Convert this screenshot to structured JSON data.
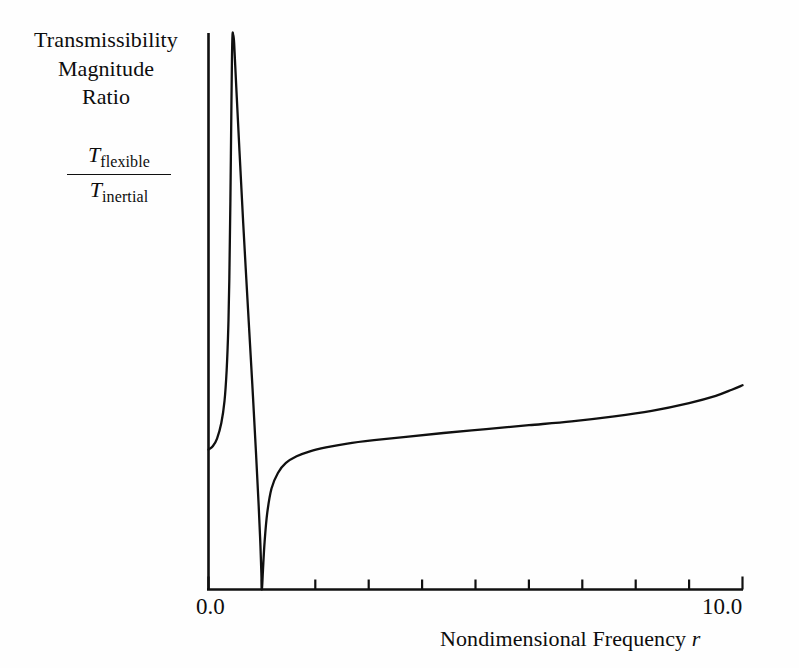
{
  "figure": {
    "background_color": "#fefefe",
    "ink_color": "#101010"
  },
  "y_axis": {
    "title_lines": [
      "Transmissibility",
      "Magnitude",
      "Ratio"
    ],
    "ratio": {
      "numerator_symbol": "T",
      "numerator_subscript": "flexible",
      "denominator_symbol": "T",
      "denominator_subscript": "inertial"
    }
  },
  "x_axis": {
    "title_prefix": "Nondimensional Frequency",
    "title_variable": "r",
    "tick_label_min": "0.0",
    "tick_label_max": "10.0"
  },
  "chart_data": {
    "type": "line",
    "title": "",
    "xlabel": "Nondimensional Frequency r",
    "ylabel": "Transmissibility Magnitude Ratio T_flexible / T_inertial",
    "xlim": [
      0.0,
      10.0
    ],
    "ylim": [
      0.0,
      1.0
    ],
    "grid": false,
    "legend": null,
    "xticks": [
      0.0,
      1.0,
      2.0,
      3.0,
      4.0,
      5.0,
      6.0,
      7.0,
      8.0,
      9.0,
      10.0
    ],
    "xtick_labels": [
      "0.0",
      "",
      "",
      "",
      "",
      "",
      "",
      "",
      "",
      "",
      "10.0"
    ],
    "yticks": [],
    "ytick_labels": [],
    "annotations": [
      "vertical asymptote (resonance) near r = 0.45",
      "zero / notch touching x-axis near r = 1.0",
      "curve truncated at top of axes frame"
    ],
    "series": [
      {
        "name": "T_flexible / T_inertial",
        "color": "#101010",
        "line_width": 2.0,
        "comment": "normalized y in [0,1]; values above 1.0 are clipped by the plot frame",
        "x": [
          0.0,
          0.08,
          0.16,
          0.24,
          0.3,
          0.34,
          0.37,
          0.39,
          0.41,
          0.43,
          0.44,
          0.45,
          0.46,
          0.48,
          0.52,
          0.58,
          0.65,
          0.74,
          0.82,
          0.89,
          0.94,
          0.97,
          0.99,
          1.0,
          1.02,
          1.05,
          1.1,
          1.18,
          1.3,
          1.45,
          1.65,
          1.9,
          2.2,
          2.6,
          3.1,
          3.7,
          4.4,
          5.2,
          6.0,
          6.8,
          7.6,
          8.3,
          9.0,
          9.5,
          9.8,
          10.0
        ],
        "y": [
          0.252,
          0.258,
          0.272,
          0.3,
          0.34,
          0.395,
          0.47,
          0.56,
          0.7,
          0.88,
          0.96,
          1.0,
          1.0,
          0.985,
          0.905,
          0.79,
          0.66,
          0.505,
          0.37,
          0.245,
          0.15,
          0.085,
          0.03,
          0.0,
          0.035,
          0.085,
          0.138,
          0.182,
          0.21,
          0.228,
          0.24,
          0.249,
          0.256,
          0.263,
          0.269,
          0.275,
          0.282,
          0.289,
          0.296,
          0.303,
          0.312,
          0.322,
          0.336,
          0.349,
          0.36,
          0.368
        ]
      }
    ]
  }
}
